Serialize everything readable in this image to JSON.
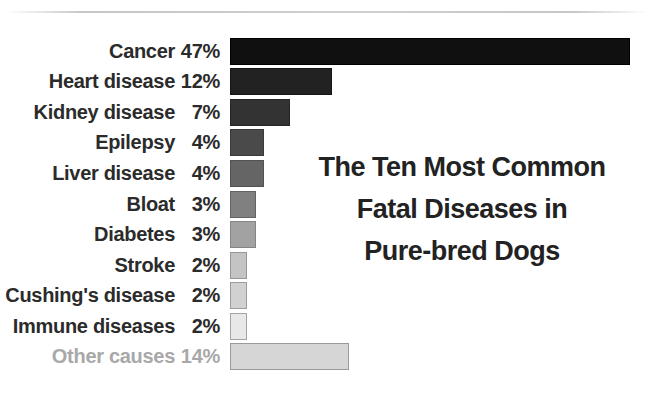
{
  "title": {
    "line1": "The Ten Most Common",
    "line2": "Fatal Diseases in",
    "line3": "Pure-bred Dogs"
  },
  "chart_data": {
    "type": "bar",
    "orientation": "horizontal",
    "title": "The Ten Most Common Fatal Diseases in Pure-bred Dogs",
    "xlabel": "",
    "ylabel": "",
    "value_unit": "%",
    "axis_range": [
      0,
      47
    ],
    "grid": false,
    "legend": "none",
    "categories": [
      "Cancer",
      "Heart disease",
      "Kidney disease",
      "Epilepsy",
      "Liver disease",
      "Bloat",
      "Diabetes",
      "Stroke",
      "Cushing's disease",
      "Immune diseases",
      "Other causes"
    ],
    "values": [
      47,
      12,
      7,
      4,
      4,
      3,
      3,
      2,
      2,
      2,
      14
    ],
    "rows": [
      {
        "label": "Cancer",
        "value": 47,
        "value_label": "47%",
        "fill": "#101010",
        "border": "#000000",
        "label_color": "#2b2b2b"
      },
      {
        "label": "Heart disease",
        "value": 12,
        "value_label": "12%",
        "fill": "#222222",
        "border": "#161616",
        "label_color": "#2b2b2b"
      },
      {
        "label": "Kidney disease",
        "value": 7,
        "value_label": "7%",
        "fill": "#333333",
        "border": "#262626",
        "label_color": "#2b2b2b"
      },
      {
        "label": "Epilepsy",
        "value": 4,
        "value_label": "4%",
        "fill": "#4a4a4a",
        "border": "#3a3a3a",
        "label_color": "#2b2b2b"
      },
      {
        "label": "Liver disease",
        "value": 4,
        "value_label": "4%",
        "fill": "#656565",
        "border": "#525252",
        "label_color": "#2b2b2b"
      },
      {
        "label": "Bloat",
        "value": 3,
        "value_label": "3%",
        "fill": "#808080",
        "border": "#636363",
        "label_color": "#2b2b2b"
      },
      {
        "label": "Diabetes",
        "value": 3,
        "value_label": "3%",
        "fill": "#a2a2a2",
        "border": "#858585",
        "label_color": "#2b2b2b"
      },
      {
        "label": "Stroke",
        "value": 2,
        "value_label": "2%",
        "fill": "#c4c4c4",
        "border": "#979797",
        "label_color": "#2b2b2b"
      },
      {
        "label": "Cushing's disease",
        "value": 2,
        "value_label": "2%",
        "fill": "#d1d1d1",
        "border": "#9c9c9c",
        "label_color": "#2b2b2b"
      },
      {
        "label": "Immune diseases",
        "value": 2,
        "value_label": "2%",
        "fill": "#e8e8e8",
        "border": "#a5a5a5",
        "label_color": "#2b2b2b"
      },
      {
        "label": "Other causes",
        "value": 14,
        "value_label": "14%",
        "fill": "#d6d6d6",
        "border": "#9a9a9a",
        "label_color": "#a8a8a8"
      }
    ]
  }
}
